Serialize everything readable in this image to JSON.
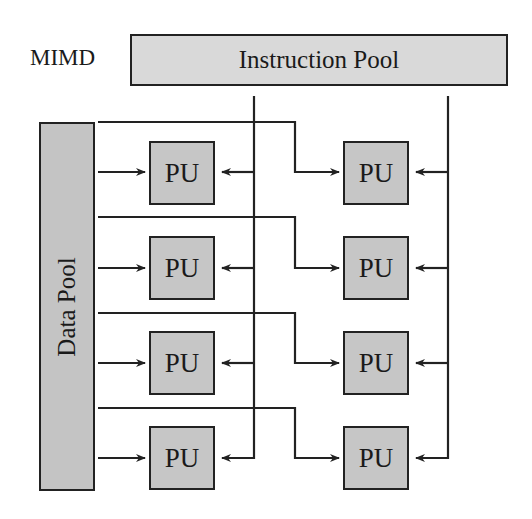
{
  "diagram": {
    "title": "MIMD",
    "instruction_pool": {
      "label": "Instruction Pool"
    },
    "data_pool": {
      "label": "Data Pool"
    },
    "processing_units": [
      {
        "label": "PU",
        "row": 1,
        "column": 1
      },
      {
        "label": "PU",
        "row": 1,
        "column": 2
      },
      {
        "label": "PU",
        "row": 2,
        "column": 1
      },
      {
        "label": "PU",
        "row": 2,
        "column": 2
      },
      {
        "label": "PU",
        "row": 3,
        "column": 1
      },
      {
        "label": "PU",
        "row": 3,
        "column": 2
      },
      {
        "label": "PU",
        "row": 4,
        "column": 1
      },
      {
        "label": "PU",
        "row": 4,
        "column": 2
      }
    ],
    "colors": {
      "box_fill": "#c6c6c6",
      "instruction_fill": "#d9d9d9",
      "stroke": "#222222"
    }
  }
}
